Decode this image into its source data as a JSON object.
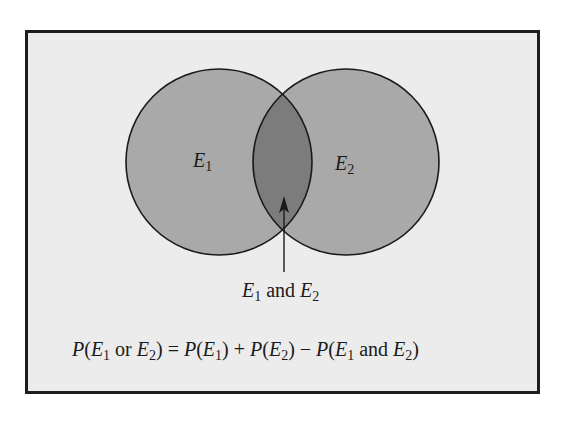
{
  "diagram": {
    "type": "venn",
    "colors": {
      "background": "#ececec",
      "frame_border": "#1e1e1e",
      "circle_fill": "#a9a9a9",
      "intersection_fill": "#7c7c7c",
      "stroke": "#1a1a1a"
    },
    "sets": [
      {
        "id": "E1",
        "label": "E",
        "subscript": "1",
        "cx": 219,
        "cy": 162,
        "r": 93
      },
      {
        "id": "E2",
        "label": "E",
        "subscript": "2",
        "cx": 346,
        "cy": 162,
        "r": 93
      }
    ],
    "intersection_label": {
      "parts": [
        {
          "text": "E",
          "italic": true,
          "sub": "1"
        },
        {
          "text": " and ",
          "italic": false
        },
        {
          "text": "E",
          "italic": true,
          "sub": "2"
        }
      ],
      "plain": "E1 and E2"
    },
    "formula": {
      "plain": "P(E1 or E2) = P(E1) + P(E2) − P(E1 and E2)",
      "P": "P",
      "E": "E",
      "sub1": "1",
      "sub2": "2",
      "or": "or",
      "and": "and",
      "eq": "=",
      "plus": "+",
      "minus": "−",
      "lparen": "(",
      "rparen": ")"
    }
  }
}
